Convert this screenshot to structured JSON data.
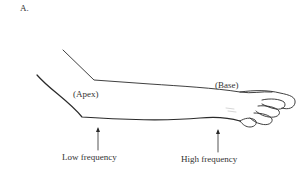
{
  "figure": {
    "panel_label": "A.",
    "labels": {
      "apex": "(Apex)",
      "base": "(Base)",
      "low_frequency": "Low frequency",
      "high_frequency": "High frequency"
    },
    "colors": {
      "line": "#2a2a2a",
      "text": "#333333",
      "background": "#ffffff"
    }
  }
}
